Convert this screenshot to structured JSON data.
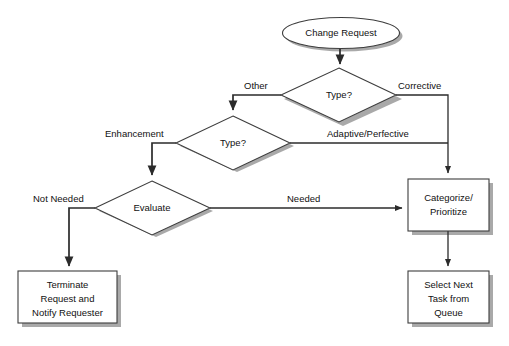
{
  "diagram": {
    "background_color": "#ffffff",
    "shape_fill_color": "#ffffff",
    "shape_border_color": "#3d3d3d",
    "shadow_color": "#9a9a9a",
    "line_color": "#2b2b2b",
    "text_color": "#111111",
    "nodes": [
      {
        "id": "change_request",
        "type": "terminator-ellipse",
        "label": "Change Request"
      },
      {
        "id": "type_1",
        "type": "decision-diamond",
        "label": "Type?"
      },
      {
        "id": "type_2",
        "type": "decision-diamond",
        "label": "Type?"
      },
      {
        "id": "evaluate",
        "type": "decision-diamond",
        "label": "Evaluate"
      },
      {
        "id": "categorize",
        "type": "process-box",
        "label_line_1": "Categorize/",
        "label_line_2": "Prioritize"
      },
      {
        "id": "terminate",
        "type": "process-box",
        "label_line_1": "Terminate",
        "label_line_2": "Request and",
        "label_line_3": "Notify Requester"
      },
      {
        "id": "select_next",
        "type": "process-box",
        "label_line_1": "Select Next",
        "label_line_2": "Task from",
        "label_line_3": "Queue"
      }
    ],
    "edge_labels": {
      "other": "Other",
      "corrective": "Corrective",
      "enhancement": "Enhancement",
      "adaptive_perfective": "Adaptive/Perfective",
      "not_needed": "Not Needed",
      "needed": "Needed"
    }
  }
}
